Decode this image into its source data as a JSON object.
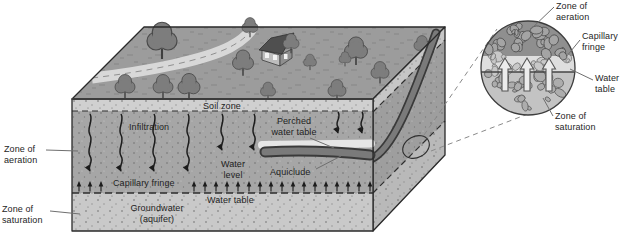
{
  "figure": {
    "type": "hydrogeology-block-diagram",
    "side_labels": {
      "zone_of_aeration": "Zone of\naeration",
      "zone_of_saturation": "Zone of\nsaturation"
    },
    "block": {
      "soil_zone": "Soil zone",
      "infiltration": "Infiltration",
      "perched_water_table": "Perched\nwater table",
      "water_level": "Water\nlevel",
      "aquiclude": "Aquiclude",
      "capillary_fringe": "Capillary fringe",
      "water_table": "Water table",
      "groundwater": "Groundwater\n(aquifer)"
    },
    "inset": {
      "zone_of_aeration": "Zone of\naeration",
      "capillary_fringe": "Capillary\nfringe",
      "water_table": "Water\ntable",
      "zone_of_saturation": "Zone of\nsaturation"
    },
    "colors": {
      "terrain_top": "#9c9c9c",
      "soil_band": "#d0d0d0",
      "zone_aeration": "#a6a6a6",
      "zone_saturation": "#c9c9c9",
      "right_face": "#9e9e9e",
      "right_face_saturation": "#b9b9b9",
      "perched_band": "#e6e6e6",
      "aquiclude": "#7a7a7a",
      "road": "#d8d8d8",
      "outline": "#2a2a2a",
      "inset_aeration": "#8f8f8f",
      "inset_capillary": "#dedede",
      "inset_saturation": "#c3c3c3"
    }
  }
}
